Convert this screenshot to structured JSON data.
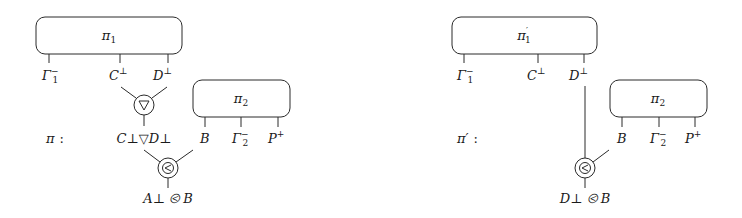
{
  "diagrams": [
    {
      "id": "pi",
      "name_label": "π :",
      "name_pos": [
        46,
        138
      ],
      "boxes": [
        {
          "id": "pi1",
          "label": "π",
          "sub": "1",
          "prime": "",
          "x": 36,
          "y": 17,
          "w": 146,
          "h": 37,
          "ports": [
            {
              "x": 49,
              "label": "Γ",
              "sub": "1",
              "sup": "−"
            },
            {
              "x": 120,
              "label": "C",
              "sub": "",
              "sup": "⊥"
            },
            {
              "x": 168,
              "label": "D",
              "sub": "",
              "sup": "⊥"
            }
          ]
        },
        {
          "id": "pi2",
          "label": "π",
          "sub": "2",
          "prime": "",
          "x": 193,
          "y": 80,
          "w": 97,
          "h": 37,
          "ports": [
            {
              "x": 205,
              "label": "B",
              "sub": "",
              "sup": ""
            },
            {
              "x": 241,
              "label": "Γ",
              "sub": "2",
              "sup": "−"
            },
            {
              "x": 278,
              "label": "P",
              "sub": "",
              "sup": "+"
            }
          ]
        }
      ],
      "nodes": [
        {
          "id": "par",
          "symbol": "▽",
          "kind": "par",
          "cx": 144,
          "cy": 105,
          "r": 10,
          "inputs": [
            [
              121,
              87
            ],
            [
              167,
              87
            ]
          ],
          "out_to": 122,
          "result": {
            "text": "C⊥▽D⊥",
            "x": 144,
            "y": 138
          }
        },
        {
          "id": "seq",
          "symbol": "<",
          "kind": "seq",
          "cx": 168,
          "cy": 168,
          "r": 10,
          "inputs": [
            [
              144,
              150
            ],
            [
              193,
              150
            ]
          ],
          "out_to": 187,
          "result": {
            "text": "A⊥ ⧀ B",
            "x": 168,
            "y": 202
          }
        }
      ]
    },
    {
      "id": "pi-prime",
      "name_label": "π′ :",
      "name_pos": [
        98,
        138
      ],
      "boxes": [
        {
          "id": "pi1-prime",
          "label": "π",
          "sub": "1",
          "prime": "′",
          "x": 452,
          "y": 17,
          "w": 145,
          "h": 37,
          "ports": [
            {
              "x": 464,
              "label": "Γ",
              "sub": "1",
              "sup": "−"
            },
            {
              "x": 538,
              "label": "C",
              "sub": "",
              "sup": "⊥"
            },
            {
              "x": 584,
              "label": "D",
              "sub": "",
              "sup": "⊥"
            }
          ]
        },
        {
          "id": "pi2-right",
          "label": "π",
          "sub": "2",
          "prime": "",
          "x": 610,
          "y": 80,
          "w": 97,
          "h": 37,
          "ports": [
            {
              "x": 622,
              "label": "B",
              "sub": "",
              "sup": ""
            },
            {
              "x": 659,
              "label": "Γ",
              "sub": "2",
              "sup": "−"
            },
            {
              "x": 695,
              "label": "P",
              "sub": "",
              "sup": "+"
            }
          ]
        }
      ],
      "nodes": [
        {
          "id": "seq-prime",
          "symbol": "<",
          "kind": "seq",
          "cx": 585,
          "cy": 168,
          "r": 10,
          "inputs": [
            [
              585,
              86
            ],
            [
              609,
              150
            ]
          ],
          "out_to": 187,
          "result": {
            "text": "D⊥ ⧀ B",
            "x": 585,
            "y": 202
          }
        }
      ]
    }
  ],
  "labels": {
    "pi_name": "π",
    "pi_prime_name": "π′",
    "colon": ":",
    "par_result": "C⊥▽D⊥",
    "seq_result_left": "A⊥ ⧀ B",
    "seq_result_right": "D⊥ ⧀ B"
  },
  "colors": {
    "stroke": "#2a2a2a",
    "text": "#1a1a1a",
    "background": "#ffffff"
  }
}
